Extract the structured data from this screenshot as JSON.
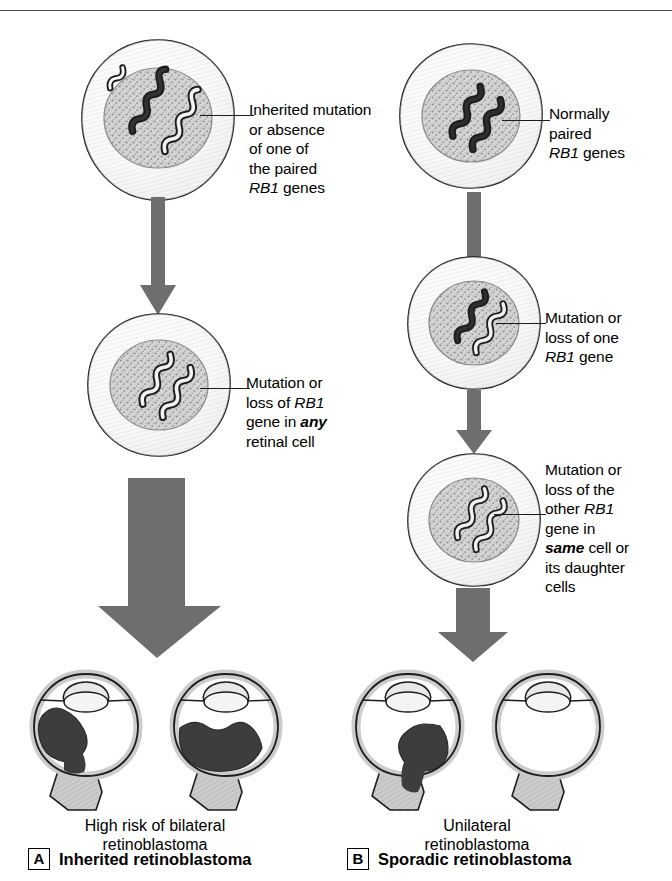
{
  "figure": {
    "colors": {
      "arrow_gray": "#6e6e6e",
      "tumor_dark": "#3d3d3d",
      "sclera_gray": "#c9c9c9",
      "nucleus_gray": "#cfcfcf",
      "outline_black": "#1d1d1d",
      "background": "#ffffff"
    }
  },
  "panels": [
    {
      "letter": "A",
      "title": "Inherited retinoblastoma",
      "outcome_caption": [
        "High risk of bilateral",
        "retinoblastoma"
      ],
      "steps": [
        {
          "id": "a-step-1",
          "label_lines": [
            {
              "text": "Inherited mutation",
              "style": "normal"
            },
            {
              "text": "or absence",
              "style": "normal"
            },
            {
              "text": "of one of",
              "style": "normal"
            },
            {
              "text": "the paired",
              "style": "normal"
            },
            {
              "text": "RB1 genes",
              "style": "gene-lead"
            }
          ],
          "chromosomes": [
            "mutant",
            "normal"
          ]
        },
        {
          "id": "a-step-2",
          "label_lines": [
            {
              "text": "Mutation or",
              "style": "normal"
            },
            {
              "text": "loss of RB1",
              "style": "gene-tail"
            },
            {
              "text": "gene in any",
              "style": "emph-tail"
            },
            {
              "text": "retinal cell",
              "style": "normal"
            }
          ],
          "chromosomes": [
            "mutant",
            "mutant"
          ]
        }
      ],
      "eyes": [
        {
          "id": "a-eye-left",
          "tumor": "large-upper-left"
        },
        {
          "id": "a-eye-right",
          "tumor": "large-lower-band"
        }
      ]
    },
    {
      "letter": "B",
      "title": "Sporadic retinoblastoma",
      "outcome_caption": [
        "Unilateral",
        "retinoblastoma"
      ],
      "steps": [
        {
          "id": "b-step-1",
          "label_lines": [
            {
              "text": "Normally",
              "style": "normal"
            },
            {
              "text": "paired",
              "style": "normal"
            },
            {
              "text": "RB1 genes",
              "style": "gene-lead"
            }
          ],
          "chromosomes": [
            "normal",
            "normal"
          ]
        },
        {
          "id": "b-step-2",
          "label_lines": [
            {
              "text": "Mutation or",
              "style": "normal"
            },
            {
              "text": "loss of one",
              "style": "normal"
            },
            {
              "text": "RB1 gene",
              "style": "gene-lead"
            }
          ],
          "chromosomes": [
            "mutant",
            "normal"
          ]
        },
        {
          "id": "b-step-3",
          "label_lines": [
            {
              "text": "Mutation or",
              "style": "normal"
            },
            {
              "text": "loss of the",
              "style": "normal"
            },
            {
              "text": "other RB1",
              "style": "gene-tail"
            },
            {
              "text": "gene in",
              "style": "normal"
            },
            {
              "text": "same cell or",
              "style": "emph-lead"
            },
            {
              "text": "its daughter",
              "style": "normal"
            },
            {
              "text": "cells",
              "style": "normal"
            }
          ],
          "chromosomes": [
            "mutant",
            "mutant"
          ]
        }
      ],
      "eyes": [
        {
          "id": "b-eye-left",
          "tumor": "medium-right"
        },
        {
          "id": "b-eye-right",
          "tumor": "none"
        }
      ]
    }
  ],
  "text": {
    "a_label_1_l1": "Inherited mutation",
    "a_label_1_l2": "or absence",
    "a_label_1_l3": "of one of",
    "a_label_1_l4": "the paired",
    "a_label_1_l5_gene": "RB1",
    "a_label_1_l5_rest": " genes",
    "a_label_2_l1": "Mutation or",
    "a_label_2_l2_pre": "loss of ",
    "a_label_2_l2_gene": "RB1",
    "a_label_2_l3_pre": "gene in ",
    "a_label_2_l3_emph": "any",
    "a_label_2_l4": "retinal cell",
    "b_label_1_l1": "Normally",
    "b_label_1_l2": "paired",
    "b_label_1_l3_gene": "RB1",
    "b_label_1_l3_rest": " genes",
    "b_label_2_l1": "Mutation or",
    "b_label_2_l2": "loss of one",
    "b_label_2_l3_gene": "RB1",
    "b_label_2_l3_rest": " gene",
    "b_label_3_l1": "Mutation or",
    "b_label_3_l2": "loss of the",
    "b_label_3_l3_pre": "other ",
    "b_label_3_l3_gene": "RB1",
    "b_label_3_l4": "gene in",
    "b_label_3_l5_emph": "same",
    "b_label_3_l5_rest": " cell or",
    "b_label_3_l6": "its daughter",
    "b_label_3_l7": "cells",
    "a_caption_l1": "High risk of bilateral",
    "a_caption_l2": "retinoblastoma",
    "b_caption_l1": "Unilateral",
    "b_caption_l2": "retinoblastoma",
    "a_panel_letter": "A",
    "a_panel_title": "Inherited retinoblastoma",
    "b_panel_letter": "B",
    "b_panel_title": "Sporadic retinoblastoma"
  }
}
